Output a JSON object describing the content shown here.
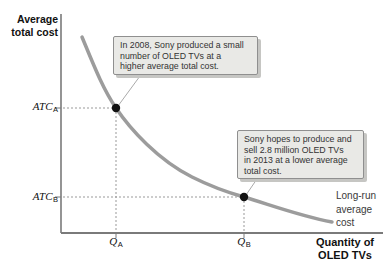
{
  "figure": {
    "y_axis_label_lines": [
      "Average",
      "total cost"
    ],
    "x_axis_label_lines": [
      "Quantity of",
      "OLED TVs"
    ],
    "curve_label_lines": [
      "Long-run",
      "average",
      "cost"
    ],
    "point_a": {
      "cost_var": "ATC",
      "cost_sub": "A",
      "qty_var": "Q",
      "qty_sub": "A"
    },
    "point_b": {
      "cost_var": "ATC",
      "cost_sub": "B",
      "qty_var": "Q",
      "qty_sub": "B"
    },
    "callout_a_lines": [
      "In 2008, Sony produced a small",
      "number of OLED TVs at a",
      "higher average total cost."
    ],
    "callout_b_lines": [
      "Sony hopes to produce and",
      "sell 2.8 million OLED TVs",
      "in 2013 at a lower average",
      "total cost."
    ]
  },
  "colors": {
    "curve": "#9c9c9c",
    "axis": "#7a7a7a",
    "guide": "#999999",
    "leader": "#aaaaaa",
    "dot": "#111111",
    "callout_bg": "#e9e9e6",
    "callout_border": "#8f8f8f",
    "callout_shadow": "#c6c6c3",
    "text": "#111111"
  },
  "chart_data": {
    "type": "line",
    "title": "",
    "xlabel": "Quantity of OLED TVs",
    "ylabel": "Average total cost",
    "grid": false,
    "legend_position": "none",
    "curve_name": "Long-run average cost",
    "shape": "downward-sloping convex curve showing economies of scale",
    "x_ticks": [
      "Q_A",
      "Q_B"
    ],
    "y_ticks": [
      "ATC_A",
      "ATC_B"
    ],
    "points": [
      {
        "x": "Q_A",
        "y": "ATC_A",
        "year": "2008",
        "annotation": "In 2008, Sony produced a small number of OLED TVs at a higher average total cost."
      },
      {
        "x": "Q_B",
        "y": "ATC_B",
        "year": "2013",
        "annotation": "Sony hopes to produce and sell 2.8 million OLED TVs in 2013 at a lower average total cost."
      }
    ],
    "render": {
      "curve_path": "M 82 37 C 94 66, 103 89, 116 108 C 130 129, 158 160, 192 177 C 210 186, 226 192, 244 197 C 271 205, 300 216, 332 222",
      "curve_color": "#9c9c9c",
      "curve_width": 3.5,
      "dot_radius": 4.2,
      "lines": [
        [
          63,
          108,
          112,
          108,
          "#999999",
          1,
          "2 2",
          "guide-atc-a-dotted"
        ],
        [
          116,
          112,
          116,
          232,
          "#999999",
          1,
          "2 2",
          "guide-qa-dotted"
        ],
        [
          63,
          197,
          240,
          197,
          "#999999",
          1,
          "2 2",
          "guide-atc-b-dotted"
        ],
        [
          244,
          201,
          244,
          232,
          "#999999",
          1,
          "2 2",
          "guide-qb-dotted"
        ],
        [
          55,
          108,
          61,
          108,
          "#7a7a7a",
          1,
          "",
          "tick-atc-a"
        ],
        [
          55,
          197,
          61,
          197,
          "#7a7a7a",
          1,
          "",
          "tick-atc-b"
        ],
        [
          116,
          233,
          116,
          238,
          "#7a7a7a",
          1,
          "",
          "tick-qa"
        ],
        [
          244,
          233,
          244,
          238,
          "#7a7a7a",
          1,
          "",
          "tick-qb"
        ],
        [
          61,
          14,
          61,
          233,
          "#7a7a7a",
          1.6,
          "",
          "y-axis-line"
        ],
        [
          61,
          233,
          383,
          233,
          "#7a7a7a",
          2,
          "",
          "x-axis-line"
        ],
        [
          140,
          76,
          118,
          106,
          "#aaaaaa",
          1,
          "",
          "callout-a-leader-line"
        ],
        [
          259,
          176,
          246,
          195,
          "#aaaaaa",
          1,
          "",
          "callout-b-leader-line"
        ]
      ],
      "dots": [
        [
          116,
          108,
          "point-a-dot"
        ],
        [
          244,
          197,
          "point-b-dot"
        ]
      ]
    }
  }
}
